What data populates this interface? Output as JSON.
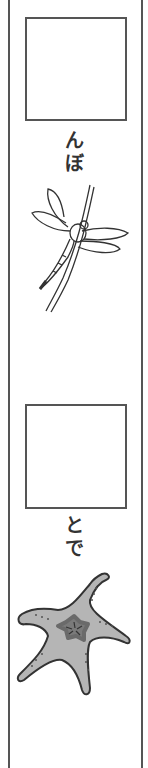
{
  "cards": [
    {
      "label_chars": [
        "ん",
        "ぼ"
      ],
      "picture": "dragonfly-icon"
    },
    {
      "label_chars": [
        "と",
        "で"
      ],
      "picture": "starfish-icon"
    }
  ],
  "colors": {
    "line": "#555555",
    "starfish_body": "#b5b5b5",
    "starfish_center": "#7a7a7a"
  }
}
